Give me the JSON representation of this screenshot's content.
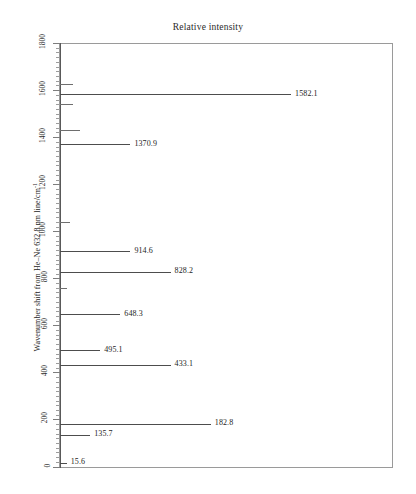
{
  "chart_data": {
    "type": "bar",
    "orientation": "horizontal",
    "title": "Relative intensity",
    "xlabel": "Relative intensity",
    "ylabel": "Wavenumber shift from He–Ne 632.8 nm line/cm",
    "ylabel_exponent": "-1",
    "ylim": [
      0,
      1800
    ],
    "xlim": [
      0,
      100
    ],
    "grid": false,
    "legend": null,
    "y_tick_labels": [
      "1800",
      "1600",
      "1400",
      "1200",
      "1000",
      "800",
      "600",
      "400",
      "200",
      "0"
    ],
    "y_tick_values": [
      1800,
      1600,
      1400,
      1200,
      1000,
      800,
      600,
      400,
      200,
      0
    ],
    "y_minor_tick_interval": 20,
    "categories": [
      1582.1,
      1370.9,
      914.6,
      828.2,
      648.3,
      495.1,
      433.1,
      182.8,
      135.7,
      15.6
    ],
    "values": [
      69,
      21,
      21,
      33,
      18,
      12,
      33,
      45,
      9,
      2
    ],
    "annotations": [
      {
        "label": "1582.1",
        "wavenumber": 1582.1,
        "intensity": 69
      },
      {
        "label": "1370.9",
        "wavenumber": 1370.9,
        "intensity": 21
      },
      {
        "label": "914.6",
        "wavenumber": 914.6,
        "intensity": 21
      },
      {
        "label": "828.2",
        "wavenumber": 828.2,
        "intensity": 33
      },
      {
        "label": "648.3",
        "wavenumber": 648.3,
        "intensity": 18
      },
      {
        "label": "495.1",
        "wavenumber": 495.1,
        "intensity": 12
      },
      {
        "label": "433.1",
        "wavenumber": 433.1,
        "intensity": 33
      },
      {
        "label": "182.8",
        "wavenumber": 182.8,
        "intensity": 45
      },
      {
        "label": "135.7",
        "wavenumber": 135.7,
        "intensity": 9
      },
      {
        "label": "15.6",
        "wavenumber": 15.6,
        "intensity": 2
      }
    ],
    "unlabeled_peaks": [
      {
        "wavenumber": 1625,
        "intensity": 4
      },
      {
        "wavenumber": 1540,
        "intensity": 4
      },
      {
        "wavenumber": 1432,
        "intensity": 6
      },
      {
        "wavenumber": 1038,
        "intensity": 3
      },
      {
        "wavenumber": 760,
        "intensity": 2
      }
    ]
  },
  "axis": {
    "title": "Relative intensity",
    "y_label_text": "Wavenumber shift from He–Ne 632.8 nm line/cm",
    "y_label_sup": "-1"
  },
  "colors": {
    "peak": "#4d4d4d",
    "frame": "#9a9a9a",
    "text": "#1d1d1d",
    "baseline": "#595959"
  }
}
